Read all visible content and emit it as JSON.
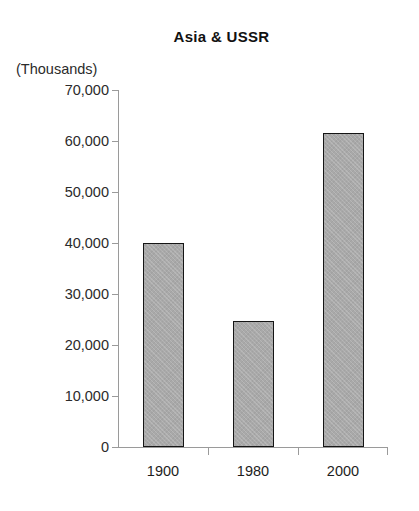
{
  "chart_data": {
    "type": "bar",
    "title": "Asia & USSR",
    "subtitle": "",
    "xlabel": "",
    "ylabel": "(Thousands)",
    "categories": [
      "1900",
      "1980",
      "2000"
    ],
    "values": [
      40000,
      24700,
      61600
    ],
    "series": [
      {
        "name": "Asia & USSR",
        "values": [
          40000,
          24700,
          61600
        ]
      }
    ],
    "ylim": [
      0,
      70000
    ],
    "yticks": [
      0,
      10000,
      20000,
      30000,
      40000,
      50000,
      60000,
      70000
    ],
    "ytick_labels": [
      "0",
      "10,000",
      "20,000",
      "30,000",
      "40,000",
      "50,000",
      "60,000",
      "70,000"
    ],
    "xtick_labels": [
      "1900",
      "1980",
      "2000"
    ],
    "grid": false,
    "legend": false,
    "legend_position": "none",
    "annotations": [],
    "colors": {
      "background": "#ffffff",
      "bar_fill": "#a9a9a9",
      "bar_border": "#151515",
      "axis": "#9a9a9a",
      "text": "#1d1d1d",
      "title": "#111111"
    }
  }
}
